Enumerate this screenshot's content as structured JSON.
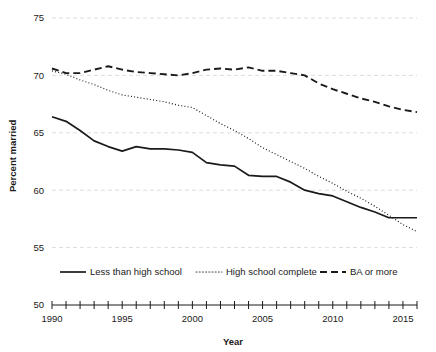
{
  "chart_data": {
    "type": "line",
    "title": "",
    "xlabel": "Year",
    "ylabel": "Percent married",
    "xlim": [
      1990,
      2016
    ],
    "ylim": [
      50,
      75
    ],
    "yticks": [
      50,
      55,
      60,
      65,
      70,
      75
    ],
    "ytick_labels": [
      "50",
      "55",
      "60",
      "65",
      "70",
      "75"
    ],
    "xticks": [
      1990,
      1991,
      1992,
      1993,
      1994,
      1995,
      1996,
      1997,
      1998,
      1999,
      2000,
      2001,
      2002,
      2003,
      2004,
      2005,
      2006,
      2007,
      2008,
      2009,
      2010,
      2011,
      2012,
      2013,
      2014,
      2015,
      2016
    ],
    "xtick_labels_shown": [
      "1990",
      "1995",
      "2000",
      "2005",
      "2010",
      "2015"
    ],
    "xtick_labels_values": [
      1990,
      1995,
      2000,
      2005,
      2010,
      2015
    ],
    "grid": "horizontal-dashed",
    "legend_position": "bottom",
    "x": [
      1990,
      1991,
      1992,
      1993,
      1994,
      1995,
      1996,
      1997,
      1998,
      1999,
      2000,
      2001,
      2002,
      2003,
      2004,
      2005,
      2006,
      2007,
      2008,
      2009,
      2010,
      2011,
      2012,
      2013,
      2014,
      2015,
      2016
    ],
    "series": [
      {
        "name": "Less than high school",
        "style": "solid",
        "color": "#1a1a1a",
        "values": [
          66.4,
          66.0,
          65.2,
          64.3,
          63.8,
          63.4,
          63.8,
          63.6,
          63.6,
          63.5,
          63.3,
          62.4,
          62.2,
          62.1,
          61.3,
          61.2,
          61.2,
          60.7,
          60.0,
          59.7,
          59.5,
          59.0,
          58.5,
          58.1,
          57.6,
          57.6,
          57.6
        ]
      },
      {
        "name": "High school complete",
        "style": "dotted",
        "color": "#4a4a4a",
        "values": [
          70.4,
          70.1,
          69.6,
          69.2,
          68.7,
          68.3,
          68.1,
          67.9,
          67.7,
          67.4,
          67.2,
          66.5,
          65.8,
          65.2,
          64.5,
          63.7,
          63.1,
          62.5,
          61.9,
          61.2,
          60.6,
          59.9,
          59.3,
          58.6,
          57.8,
          57.0,
          56.4
        ]
      },
      {
        "name": "BA or more",
        "style": "dashed",
        "color": "#1a1a1a",
        "values": [
          70.6,
          70.2,
          70.2,
          70.5,
          70.8,
          70.5,
          70.3,
          70.2,
          70.1,
          70.0,
          70.2,
          70.5,
          70.6,
          70.5,
          70.7,
          70.4,
          70.4,
          70.2,
          70.0,
          69.3,
          68.8,
          68.4,
          68.0,
          67.7,
          67.3,
          67.0,
          66.8
        ]
      }
    ]
  },
  "legend": {
    "items": [
      {
        "label": "Less than high school",
        "style": "solid"
      },
      {
        "label": "High school complete",
        "style": "dotted"
      },
      {
        "label": "BA or more",
        "style": "dashed"
      }
    ]
  },
  "axes": {
    "y_title": "Percent married",
    "x_title": "Year"
  }
}
